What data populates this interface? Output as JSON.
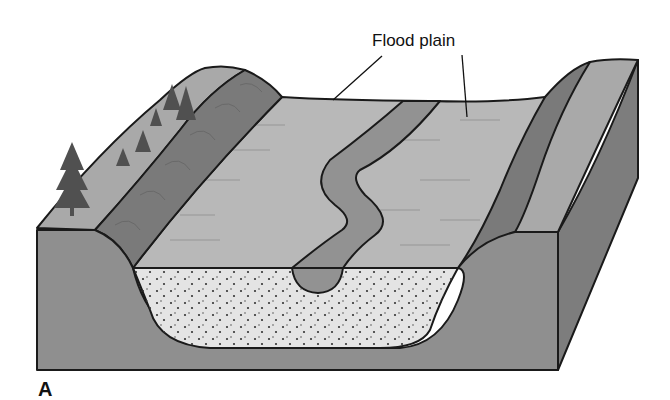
{
  "figure": {
    "panel_label": "A",
    "labels": [
      {
        "id": "flood_plain",
        "text": "Flood plain"
      }
    ]
  },
  "colors": {
    "front_face": "#8f8f8f",
    "right_face": "#7d7d7d",
    "floodplain": "#b8b8b8",
    "channel": "#929292",
    "slope_dark": "#7a7a7a",
    "ridge_top": "#a9a9a9",
    "sediment": "#e4e4e4",
    "tree": "#505050",
    "outline": "#1a1a1a"
  }
}
